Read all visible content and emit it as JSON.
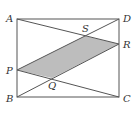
{
  "figure": {
    "type": "geometry-diagram",
    "colors": {
      "stroke": "#555555",
      "shade": "#bdbdbd",
      "label": "#333333"
    },
    "points": {
      "A": {
        "label": "A",
        "x": 17,
        "y": 19
      },
      "D": {
        "label": "D",
        "x": 119,
        "y": 19
      },
      "B": {
        "label": "B",
        "x": 17,
        "y": 97
      },
      "C": {
        "label": "C",
        "x": 119,
        "y": 97
      },
      "P": {
        "label": "P",
        "x": 17,
        "y": 70
      },
      "R": {
        "label": "R",
        "x": 119,
        "y": 44
      },
      "S": {
        "label": "S",
        "x": 85,
        "y": 36
      },
      "Q": {
        "label": "Q",
        "x": 52,
        "y": 78
      }
    },
    "segments": [
      "AD",
      "DC",
      "CB",
      "BA",
      "AR",
      "PC",
      "PD",
      "BR"
    ],
    "shaded_polygon": [
      "P",
      "S",
      "R",
      "Q"
    ]
  }
}
